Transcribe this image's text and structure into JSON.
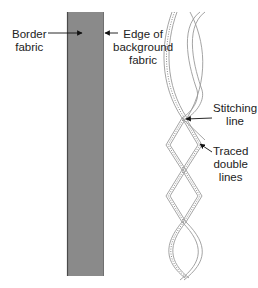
{
  "diagram": {
    "labels": {
      "border_fabric": [
        "Border",
        "fabric"
      ],
      "edge_of_background_fabric": [
        "Edge of",
        "background",
        "fabric"
      ],
      "stitching_line": [
        "Stitching",
        "line"
      ],
      "traced_double_lines": [
        "Traced",
        "double",
        "lines"
      ]
    },
    "colors": {
      "border_fabric_fill": "#8a8a8a",
      "border_fabric_edge": "#4a4a4a",
      "strand_line": "#9a9a9a",
      "text": "#222222"
    }
  }
}
